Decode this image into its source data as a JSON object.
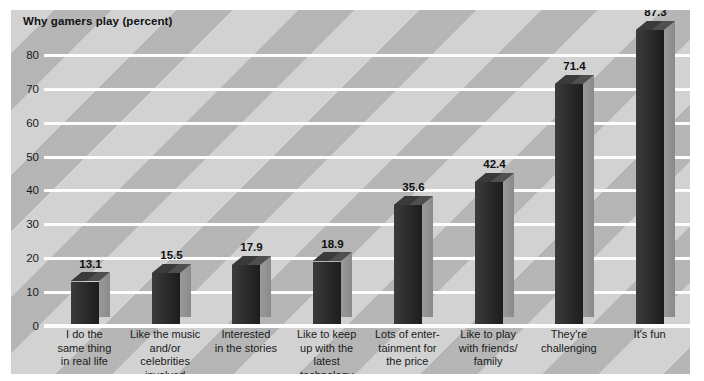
{
  "chart_data": {
    "type": "bar",
    "title": "Why gamers play (percent)",
    "xlabel": "",
    "ylabel": "",
    "ylim": [
      0,
      85
    ],
    "yticks": [
      0,
      10,
      20,
      30,
      40,
      50,
      60,
      70,
      80
    ],
    "grid": true,
    "legend": false,
    "style_3d": true,
    "categories": [
      "I do the same thing in real life",
      "Like the music and/or celebrities involved",
      "Interested in the stories",
      "Like to keep up with the latest technology",
      "Lots of entertainment for the price",
      "Like to play with friends/family",
      "They're challenging",
      "It's fun"
    ],
    "category_lines": [
      [
        "I do the",
        "same thing",
        "in real life"
      ],
      [
        "Like the music",
        "and/or celebrities",
        "involved"
      ],
      [
        "Interested",
        "in the stories"
      ],
      [
        "Like to keep",
        "up with the",
        "latest technology"
      ],
      [
        "Lots of enter-",
        "tainment for",
        "the price"
      ],
      [
        "Like to play",
        "with friends/",
        "family"
      ],
      [
        "They're",
        "challenging"
      ],
      [
        "It's fun"
      ]
    ],
    "values": [
      13.1,
      15.5,
      17.9,
      18.9,
      35.6,
      42.4,
      71.4,
      87.3
    ],
    "value_labels": [
      "13.1",
      "15.5",
      "17.9",
      "18.9",
      "35.6",
      "42.4",
      "71.4",
      "87.3"
    ],
    "colors": {
      "plot_background": "#d2d2d2",
      "stripe": "#9e9e9e",
      "gridline": "#fdfdfd",
      "bar_front": "#2a2a2a",
      "bar_side": "#919191",
      "bar_top": "#575757",
      "text": "#1a1a1a"
    }
  }
}
